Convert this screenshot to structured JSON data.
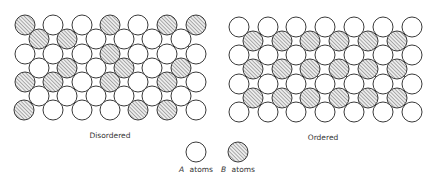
{
  "figure": {
    "panels": [
      {
        "id": "disordered",
        "label": "Disordered",
        "label_pos": [
          110,
          138
        ],
        "radius": 10,
        "rows": [
          {
            "y": 25,
            "x": [
              25,
              53,
              82,
              110,
              138,
              167,
              196
            ],
            "types": [
              "B",
              "A",
              "A",
              "B",
              "A",
              "B",
              "B"
            ]
          },
          {
            "y": 39,
            "x": [
              39,
              67,
              96,
              124,
              152,
              181
            ],
            "types": [
              "B",
              "B",
              "A",
              "A",
              "A",
              "A"
            ]
          },
          {
            "y": 54,
            "x": [
              25,
              53,
              82,
              110,
              138,
              167,
              196
            ],
            "types": [
              "A",
              "A",
              "A",
              "B",
              "A",
              "A",
              "A"
            ]
          },
          {
            "y": 68,
            "x": [
              39,
              67,
              96,
              124,
              152,
              181
            ],
            "types": [
              "A",
              "B",
              "A",
              "B",
              "A",
              "B"
            ]
          },
          {
            "y": 82,
            "x": [
              25,
              53,
              82,
              110,
              138,
              167,
              196
            ],
            "types": [
              "B",
              "B",
              "A",
              "B",
              "A",
              "B",
              "A"
            ]
          },
          {
            "y": 96,
            "x": [
              39,
              67,
              96,
              124,
              152,
              181
            ],
            "types": [
              "A",
              "A",
              "A",
              "A",
              "A",
              "A"
            ]
          },
          {
            "y": 110,
            "x": [
              24,
              53,
              82,
              110,
              138,
              167,
              196
            ],
            "types": [
              "B",
              "A",
              "A",
              "A",
              "B",
              "B",
              "A"
            ]
          }
        ]
      },
      {
        "id": "ordered",
        "label": "Ordered",
        "label_pos": [
          323,
          140
        ],
        "radius": 10,
        "rows": [
          {
            "y": 27,
            "x": [
              239,
              268,
              296,
              325,
              354,
              383,
              412
            ],
            "types": [
              "A",
              "A",
              "A",
              "A",
              "A",
              "A",
              "A"
            ]
          },
          {
            "y": 41,
            "x": [
              253,
              282,
              310,
              339,
              368,
              397
            ],
            "types": [
              "B",
              "B",
              "B",
              "B",
              "B",
              "B"
            ]
          },
          {
            "y": 55,
            "x": [
              239,
              268,
              296,
              325,
              354,
              383,
              412
            ],
            "types": [
              "A",
              "A",
              "A",
              "A",
              "A",
              "A",
              "A"
            ]
          },
          {
            "y": 69,
            "x": [
              253,
              282,
              310,
              339,
              368,
              397
            ],
            "types": [
              "B",
              "B",
              "B",
              "B",
              "B",
              "B"
            ]
          },
          {
            "y": 84,
            "x": [
              239,
              268,
              296,
              325,
              354,
              383,
              412
            ],
            "types": [
              "A",
              "A",
              "A",
              "A",
              "A",
              "A",
              "A"
            ]
          },
          {
            "y": 98,
            "x": [
              253,
              282,
              310,
              339,
              368,
              397
            ],
            "types": [
              "B",
              "B",
              "B",
              "B",
              "B",
              "B"
            ]
          },
          {
            "y": 112,
            "x": [
              239,
              268,
              296,
              325,
              354,
              383,
              412
            ],
            "types": [
              "A",
              "A",
              "A",
              "A",
              "A",
              "A",
              "A"
            ]
          }
        ]
      }
    ],
    "legend": {
      "items": [
        {
          "type": "A",
          "symbol": "open-circle",
          "letter": "A",
          "text": "atoms",
          "cx": 196,
          "cy": 152,
          "label_x": 196,
          "label_y": 172
        },
        {
          "type": "B",
          "symbol": "hatched-circle",
          "letter": "B",
          "text": "atoms",
          "cx": 238,
          "cy": 152,
          "label_x": 238,
          "label_y": 172
        }
      ]
    },
    "colors": {
      "background": "#ffffff",
      "stroke": "#3a3a3a",
      "hatch": "#6a6a6a",
      "hatch_fill": "#e8e8e8"
    }
  }
}
